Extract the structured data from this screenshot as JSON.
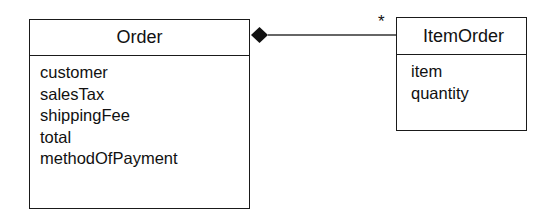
{
  "classes": {
    "order": {
      "name": "Order",
      "attributes": [
        "customer",
        "salesTax",
        "shippingFee",
        "total",
        "methodOfPayment"
      ]
    },
    "item_order": {
      "name": "ItemOrder",
      "attributes": [
        "item",
        "quantity"
      ]
    }
  },
  "association": {
    "type": "composition",
    "whole": "Order",
    "part": "ItemOrder",
    "part_multiplicity": "*"
  }
}
